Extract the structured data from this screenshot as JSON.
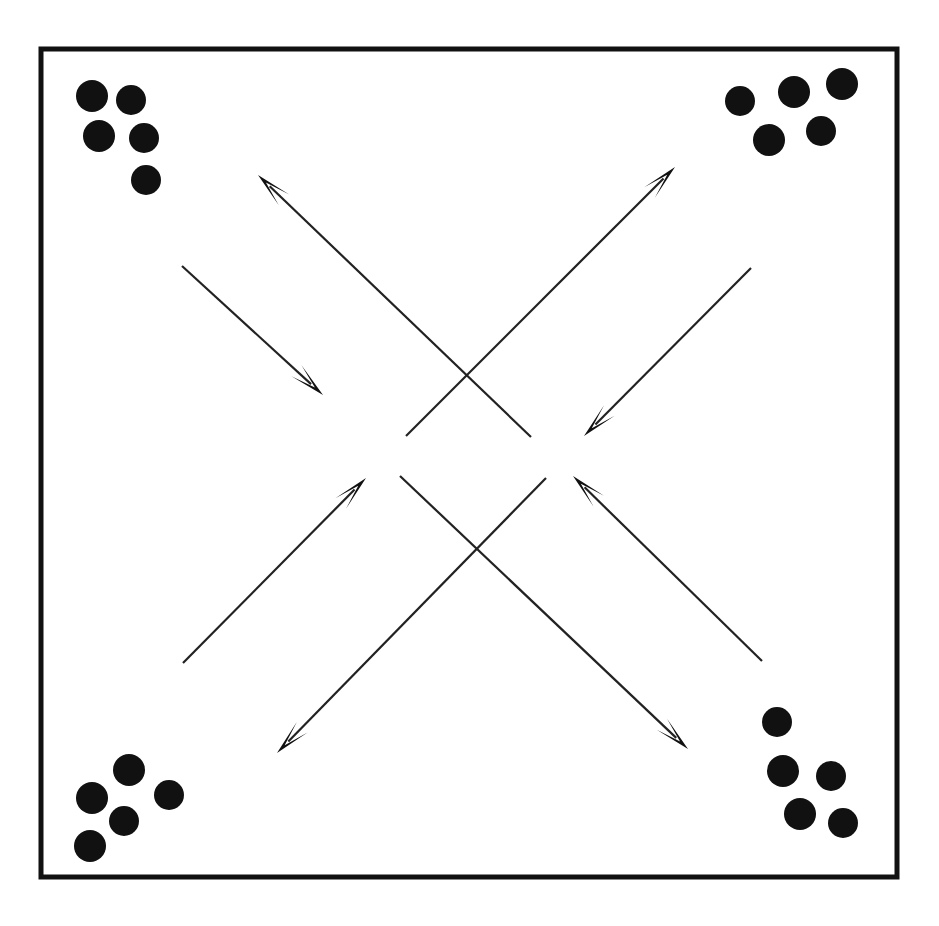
{
  "figure": {
    "canvas": {
      "width": 939,
      "height": 926,
      "background": "#ffffff"
    },
    "frame": {
      "label": "outer-border-box",
      "x": 41,
      "y": 49,
      "width": 856,
      "height": 828,
      "stroke_color": "#111111",
      "stroke_width": 5
    },
    "dot_style": {
      "fill_color": "#111111",
      "radius": 15
    },
    "line_style": {
      "stroke_color": "#222222",
      "stroke_width": 2.2
    },
    "clusters": [
      {
        "name": "top-left-cluster",
        "count": 5,
        "dots": [
          {
            "cx": 92,
            "cy": 96,
            "r": 16
          },
          {
            "cx": 131,
            "cy": 100,
            "r": 15
          },
          {
            "cx": 99,
            "cy": 136,
            "r": 16
          },
          {
            "cx": 144,
            "cy": 138,
            "r": 15
          },
          {
            "cx": 146,
            "cy": 180,
            "r": 15
          }
        ]
      },
      {
        "name": "top-right-cluster",
        "count": 5,
        "dots": [
          {
            "cx": 740,
            "cy": 101,
            "r": 15
          },
          {
            "cx": 794,
            "cy": 92,
            "r": 16
          },
          {
            "cx": 842,
            "cy": 84,
            "r": 16
          },
          {
            "cx": 769,
            "cy": 140,
            "r": 16
          },
          {
            "cx": 821,
            "cy": 131,
            "r": 15
          }
        ]
      },
      {
        "name": "bottom-left-cluster",
        "count": 5,
        "dots": [
          {
            "cx": 129,
            "cy": 770,
            "r": 16
          },
          {
            "cx": 92,
            "cy": 798,
            "r": 16
          },
          {
            "cx": 169,
            "cy": 795,
            "r": 15
          },
          {
            "cx": 124,
            "cy": 821,
            "r": 15
          },
          {
            "cx": 90,
            "cy": 846,
            "r": 16
          }
        ]
      },
      {
        "name": "bottom-right-cluster",
        "count": 5,
        "dots": [
          {
            "cx": 777,
            "cy": 722,
            "r": 15
          },
          {
            "cx": 783,
            "cy": 771,
            "r": 16
          },
          {
            "cx": 831,
            "cy": 776,
            "r": 15
          },
          {
            "cx": 800,
            "cy": 814,
            "r": 16
          },
          {
            "cx": 843,
            "cy": 823,
            "r": 15
          }
        ]
      }
    ],
    "arrows": [
      {
        "name": "arrow-upper-inner-to-top-left",
        "direction": "up-left",
        "tail_x": 531,
        "tail_y": 437,
        "head_x": 258,
        "head_y": 175
      },
      {
        "name": "arrow-upper-inner-to-top-right",
        "direction": "up-right",
        "tail_x": 406,
        "tail_y": 436,
        "head_x": 675,
        "head_y": 167
      },
      {
        "name": "arrow-upper-left-outer-inward",
        "direction": "down-right",
        "tail_x": 182,
        "tail_y": 266,
        "head_x": 323,
        "head_y": 395
      },
      {
        "name": "arrow-upper-right-outer-inward",
        "direction": "down-left",
        "tail_x": 751,
        "tail_y": 268,
        "head_x": 584,
        "head_y": 436
      },
      {
        "name": "arrow-lower-left-outer-inward",
        "direction": "up-right",
        "tail_x": 183,
        "tail_y": 663,
        "head_x": 366,
        "head_y": 478
      },
      {
        "name": "arrow-lower-right-outer-inward",
        "direction": "up-left",
        "tail_x": 762,
        "tail_y": 661,
        "head_x": 573,
        "head_y": 476
      },
      {
        "name": "arrow-lower-inner-to-bottom-left",
        "direction": "down-left",
        "tail_x": 546,
        "tail_y": 478,
        "head_x": 277,
        "head_y": 753
      },
      {
        "name": "arrow-lower-inner-to-bottom-right",
        "direction": "down-right",
        "tail_x": 400,
        "tail_y": 476,
        "head_x": 688,
        "head_y": 749
      }
    ]
  }
}
